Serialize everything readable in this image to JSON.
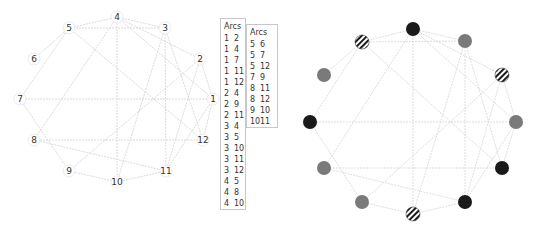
{
  "left_graph": {
    "nodes": [
      {
        "id": "1",
        "x": 213,
        "y": 99
      },
      {
        "id": "2",
        "x": 200,
        "y": 59
      },
      {
        "id": "3",
        "x": 165,
        "y": 28
      },
      {
        "id": "4",
        "x": 117,
        "y": 17
      },
      {
        "id": "5",
        "x": 69,
        "y": 28
      },
      {
        "id": "6",
        "x": 34,
        "y": 59
      },
      {
        "id": "7",
        "x": 20,
        "y": 99
      },
      {
        "id": "8",
        "x": 34,
        "y": 140
      },
      {
        "id": "9",
        "x": 69,
        "y": 171
      },
      {
        "id": "10",
        "x": 117,
        "y": 182
      },
      {
        "id": "11",
        "x": 166,
        "y": 171
      },
      {
        "id": "12",
        "x": 203,
        "y": 140
      }
    ]
  },
  "arcs_table_1": {
    "header": "Arcs",
    "rows": [
      [
        "1",
        "2"
      ],
      [
        "1",
        "4"
      ],
      [
        "1",
        "7"
      ],
      [
        "1",
        "11"
      ],
      [
        "1",
        "12"
      ],
      [
        "2",
        "4"
      ],
      [
        "2",
        "9"
      ],
      [
        "2",
        "11"
      ],
      [
        "3",
        "4"
      ],
      [
        "3",
        "5"
      ],
      [
        "3",
        "10"
      ],
      [
        "3",
        "11"
      ],
      [
        "3",
        "12"
      ],
      [
        "4",
        "5"
      ],
      [
        "4",
        "8"
      ],
      [
        "4",
        "10"
      ]
    ]
  },
  "arcs_table_2": {
    "header": "Arcs",
    "rows": [
      [
        "5",
        "6"
      ],
      [
        "5",
        "7"
      ],
      [
        "5",
        "12"
      ],
      [
        "7",
        "9"
      ],
      [
        "8",
        "11"
      ],
      [
        "8",
        "12"
      ],
      [
        "9",
        "10"
      ],
      [
        "10",
        "11"
      ]
    ]
  },
  "right_graph": {
    "colors": {
      "black": "#1a1a1a",
      "gray": "#7a7a7a",
      "edge": "#d4d4d4"
    },
    "nodes": [
      {
        "id": "1",
        "x": 516,
        "y": 122,
        "style": "gray"
      },
      {
        "id": "2",
        "x": 502,
        "y": 75,
        "style": "striped"
      },
      {
        "id": "3",
        "x": 465,
        "y": 41,
        "style": "gray"
      },
      {
        "id": "4",
        "x": 413,
        "y": 29,
        "style": "black"
      },
      {
        "id": "5",
        "x": 362,
        "y": 42,
        "style": "striped"
      },
      {
        "id": "6",
        "x": 324,
        "y": 75,
        "style": "gray"
      },
      {
        "id": "7",
        "x": 310,
        "y": 122,
        "style": "black"
      },
      {
        "id": "8",
        "x": 324,
        "y": 168,
        "style": "gray"
      },
      {
        "id": "9",
        "x": 362,
        "y": 202,
        "style": "gray"
      },
      {
        "id": "10",
        "x": 413,
        "y": 214,
        "style": "striped"
      },
      {
        "id": "11",
        "x": 465,
        "y": 202,
        "style": "black"
      },
      {
        "id": "12",
        "x": 502,
        "y": 168,
        "style": "black"
      }
    ]
  }
}
